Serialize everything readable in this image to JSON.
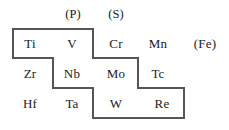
{
  "figure": {
    "kind": "periodic-table-fragment",
    "outline_color": "#555555",
    "text_color": "#1a1a1a",
    "background_color": "#ffffff"
  },
  "headers": [
    {
      "id": "p",
      "label": "(P)",
      "x": 73,
      "y": 14
    },
    {
      "id": "s",
      "label": "(S)",
      "x": 116,
      "y": 14
    }
  ],
  "rows": [
    {
      "id": "row-1",
      "y": 44,
      "cells": [
        {
          "id": "ti",
          "label": "Ti",
          "x": 30,
          "inside_outline": true
        },
        {
          "id": "v",
          "label": "V",
          "x": 72,
          "inside_outline": true
        },
        {
          "id": "cr",
          "label": "Cr",
          "x": 116,
          "inside_outline": true
        },
        {
          "id": "mn",
          "label": "Mn",
          "x": 158,
          "inside_outline": false
        },
        {
          "id": "fe",
          "label": "(Fe)",
          "x": 205,
          "inside_outline": false
        }
      ]
    },
    {
      "id": "row-2",
      "y": 74,
      "cells": [
        {
          "id": "zr",
          "label": "Zr",
          "x": 30,
          "inside_outline": false
        },
        {
          "id": "nb",
          "label": "Nb",
          "x": 72,
          "inside_outline": true
        },
        {
          "id": "mo",
          "label": "Mo",
          "x": 116,
          "inside_outline": true
        },
        {
          "id": "tc",
          "label": "Tc",
          "x": 158,
          "inside_outline": true
        }
      ]
    },
    {
      "id": "row-3",
      "y": 104,
      "cells": [
        {
          "id": "hf",
          "label": "Hf",
          "x": 30,
          "inside_outline": false
        },
        {
          "id": "ta",
          "label": "Ta",
          "x": 72,
          "inside_outline": false
        },
        {
          "id": "w",
          "label": "W",
          "x": 116,
          "inside_outline": true
        },
        {
          "id": "re",
          "label": "Re",
          "x": 162,
          "inside_outline": true
        }
      ]
    }
  ],
  "outline": {
    "stroke_width": 1.2,
    "points": "13,29 93,29 93,58 138,58 138,88 184,88 184,118 93,118 93,88 53,88 53,58 13,58 13,29"
  }
}
